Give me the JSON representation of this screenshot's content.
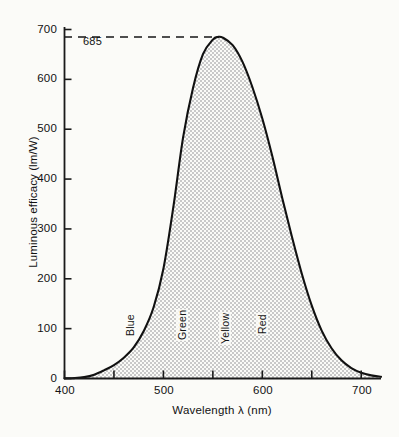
{
  "figure": {
    "background_color": "#fbfbf8",
    "curve_color": "#111111",
    "fill_color": "#d8d8d8"
  },
  "axes": {
    "x_title": "Wavelength λ  (nm)",
    "y_title": "Luminous efficacy  (lm/W)",
    "x_tick_labels": [
      "400",
      "500",
      "600",
      "700"
    ],
    "y_tick_labels": [
      "0",
      "100",
      "200",
      "300",
      "400",
      "500",
      "600",
      "700"
    ]
  },
  "annotation": {
    "peak_label": "685"
  },
  "bands": [
    {
      "label": "Blue"
    },
    {
      "label": "Green"
    },
    {
      "label": "Yellow"
    },
    {
      "label": "Red"
    }
  ],
  "chart_data": {
    "type": "area",
    "title": "",
    "subtitle": "",
    "xlabel": "Wavelength λ  (nm)",
    "ylabel": "Luminous efficacy  (lm/W)",
    "xlim": [
      400,
      720
    ],
    "ylim": [
      0,
      700
    ],
    "x_ticks": [
      400,
      450,
      500,
      550,
      600,
      650,
      700
    ],
    "x_tick_labels": [
      "400",
      "",
      "500",
      "",
      "600",
      "",
      "700"
    ],
    "y_ticks": [
      0,
      100,
      200,
      300,
      400,
      500,
      600,
      700
    ],
    "grid": false,
    "legend": "none",
    "fill": true,
    "annotations": [
      {
        "text": "685",
        "type": "horizontal-dashed-line",
        "y": 685,
        "x_from": 400,
        "x_to": 545,
        "note": "peak luminous efficacy 685 lm/W at 555 nm"
      },
      {
        "text": "Blue",
        "type": "band-label",
        "x": 455,
        "y": 140,
        "rotation": 90
      },
      {
        "text": "Green",
        "type": "band-label",
        "x": 513,
        "y": 140,
        "rotation": 90
      },
      {
        "text": "Yellow",
        "type": "band-label",
        "x": 560,
        "y": 140,
        "rotation": 90
      },
      {
        "text": "Red",
        "type": "band-label",
        "x": 602,
        "y": 140,
        "rotation": 90
      }
    ],
    "series": [
      {
        "name": "Photopic luminous efficacy",
        "x": [
          400,
          410,
          420,
          430,
          440,
          450,
          460,
          470,
          480,
          490,
          500,
          510,
          520,
          530,
          540,
          550,
          555,
          560,
          570,
          580,
          590,
          600,
          610,
          620,
          630,
          640,
          650,
          660,
          670,
          680,
          690,
          700,
          710,
          720
        ],
        "values": [
          0.3,
          0.8,
          2.7,
          7.6,
          16.4,
          26.9,
          41.7,
          62.2,
          94.7,
          142.3,
          220.1,
          343.2,
          484.5,
          583.3,
          650.5,
          679.6,
          685.0,
          683.8,
          668.6,
          635.0,
          584.2,
          521.4,
          446.6,
          363.2,
          283.7,
          209.5,
          146.0,
          96.1,
          60.6,
          36.4,
          21.0,
          11.6,
          6.3,
          3.4
        ]
      }
    ]
  }
}
